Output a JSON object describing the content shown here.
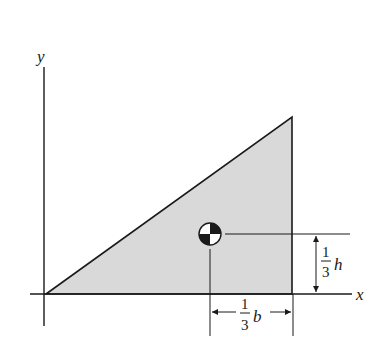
{
  "diagram": {
    "axes": {
      "x_label": "x",
      "y_label": "y"
    },
    "shape": {
      "type": "right-triangle",
      "fill": "#d9d9d9",
      "stroke": "#1a1a1a"
    },
    "centroid": {
      "symbol": "centroid-marker"
    },
    "dimensions": {
      "horizontal": {
        "numerator": "1",
        "denominator": "3",
        "variable": "b"
      },
      "vertical": {
        "numerator": "1",
        "denominator": "3",
        "variable": "h"
      }
    }
  }
}
